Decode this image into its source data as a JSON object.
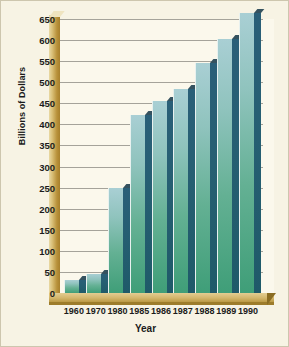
{
  "chart_data": {
    "type": "bar",
    "title": "",
    "xlabel": "Year",
    "ylabel": "Billions of Dollars",
    "categories": [
      "1960",
      "1970",
      "1980",
      "1985",
      "1986",
      "1987",
      "1988",
      "1989",
      "1990"
    ],
    "values": [
      30,
      45,
      250,
      422,
      455,
      483,
      545,
      602,
      665
    ],
    "ylim": [
      0,
      650
    ],
    "yticks": [
      0,
      50,
      100,
      150,
      200,
      250,
      300,
      350,
      400,
      450,
      500,
      550,
      600,
      650
    ],
    "ytick_labels": [
      "0",
      "50",
      "100",
      "150",
      "200",
      "250",
      "300",
      "350",
      "400",
      "450",
      "500",
      "550",
      "600",
      "650"
    ],
    "grid": true,
    "legend": false,
    "series": [
      {
        "name": "Billions of Dollars",
        "values": [
          30,
          45,
          250,
          422,
          455,
          483,
          545,
          602,
          665
        ]
      }
    ],
    "style": {
      "bar_face_top_color": "#a9cfd4",
      "bar_face_bottom_color": "#3f9e78",
      "bar_side_color": "#265f72",
      "axis_wall_color": "#b8913a",
      "floor_color": "#d3b66c",
      "background_color": "#f7f3e4",
      "plot_background_color": "#fbf8ec",
      "gridline_color": "#6f6f68",
      "text_color": "#1b1b1b"
    }
  }
}
